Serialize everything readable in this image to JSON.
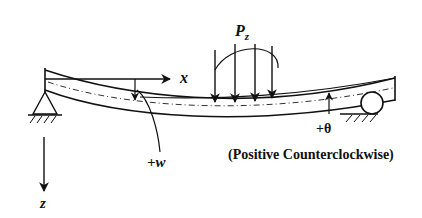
{
  "diagram": {
    "type": "beam-deflection-sign-convention",
    "labels": {
      "load": "P",
      "load_subscript": "z",
      "x_axis": "x",
      "z_axis": "z",
      "deflection": "+w",
      "rotation": "+θ",
      "rotation_note": "(Positive Counterclockwise)"
    },
    "supports": {
      "left": "pin",
      "right": "roller"
    },
    "load_arrow_count": 4,
    "colors": {
      "ink": "#111111",
      "background": "#ffffff"
    }
  }
}
